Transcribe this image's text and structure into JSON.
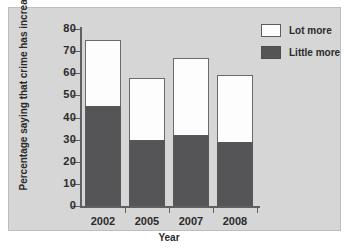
{
  "chart_data": {
    "type": "bar",
    "title": "",
    "subtitle": "",
    "xlabel": "Year",
    "ylabel": "Percentage saying that crime has increased",
    "categories": [
      "2002",
      "2005",
      "2007",
      "2008"
    ],
    "series": [
      {
        "name": "Little more",
        "color": "#555557",
        "values": [
          45,
          30,
          32,
          29
        ]
      },
      {
        "name": "Lot more",
        "color": "#ffffff",
        "values": [
          30,
          28,
          35,
          30
        ]
      }
    ],
    "totals": [
      75,
      58,
      67,
      59
    ],
    "stacked": true,
    "ylim": [
      0,
      80
    ],
    "yticks": [
      0,
      10,
      20,
      30,
      40,
      50,
      60,
      70,
      80
    ],
    "ytick_labels": [
      "0",
      "10",
      "20",
      "30",
      "40",
      "50",
      "60",
      "70",
      "80"
    ],
    "grid": false,
    "legend_position": "top-right",
    "legend_entries": [
      "Lot more",
      "Little more"
    ],
    "panel_color": "#d6d6d6",
    "axis_color": "#606062",
    "text_color": "#2b2b2b"
  }
}
